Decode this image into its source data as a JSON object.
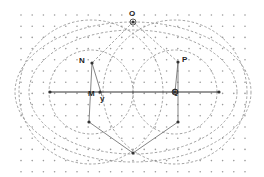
{
  "diagram": {
    "type": "geometry-construction",
    "background": "#ffffff",
    "grid": {
      "style": "dots",
      "color": "#9a9a9a",
      "spacing": 11.2,
      "x0": 21,
      "y0": 15,
      "cols": 21,
      "rows": 15
    },
    "axis_line": {
      "x1": 50,
      "y1": 92,
      "x2": 219,
      "y2": 92,
      "color": "#333333"
    },
    "points": [
      {
        "id": "O",
        "label": "O",
        "x": 133,
        "y": 22
      },
      {
        "id": "N",
        "label": "N",
        "x": 92,
        "y": 63
      },
      {
        "id": "P",
        "label": "P",
        "x": 178,
        "y": 62
      },
      {
        "id": "M",
        "label": "M",
        "x": 100,
        "y": 92
      },
      {
        "id": "Q",
        "label": "Q",
        "x": 175,
        "y": 92
      },
      {
        "id": "y",
        "label": "y",
        "x": 102,
        "y": 96
      },
      {
        "id": "A",
        "label": "",
        "x": 89,
        "y": 122
      },
      {
        "id": "B",
        "label": "",
        "x": 178,
        "y": 122
      },
      {
        "id": "C",
        "label": "",
        "x": 133,
        "y": 153
      },
      {
        "id": "L",
        "label": "",
        "x": 50,
        "y": 92
      },
      {
        "id": "R",
        "label": "",
        "x": 219,
        "y": 92
      }
    ],
    "label_positions": {
      "O": {
        "x": 129,
        "y": 10
      },
      "N": {
        "x": 79,
        "y": 57
      },
      "P": {
        "x": 182,
        "y": 56
      },
      "M": {
        "x": 88,
        "y": 90
      },
      "Q": {
        "x": 172,
        "y": 88
      },
      "y": {
        "x": 100,
        "y": 95
      }
    },
    "dashed_curves": [
      {
        "name": "outer-ellipse",
        "cx": 133,
        "cy": 92,
        "rx": 118,
        "ry": 70
      },
      {
        "name": "middle-ellipse",
        "cx": 133,
        "cy": 92,
        "rx": 104,
        "ry": 62
      },
      {
        "name": "left-circle-large",
        "cx": 91,
        "cy": 92,
        "r": 72
      },
      {
        "name": "right-circle-large",
        "cx": 175,
        "cy": 92,
        "r": 72
      },
      {
        "name": "left-circle-small",
        "cx": 91,
        "cy": 92,
        "r": 42
      },
      {
        "name": "right-circle-small",
        "cx": 175,
        "cy": 92,
        "r": 42
      }
    ],
    "segments": [
      {
        "from": "N",
        "to": "A"
      },
      {
        "from": "P",
        "to": "B"
      },
      {
        "from": "A",
        "to": "C"
      },
      {
        "from": "B",
        "to": "C"
      },
      {
        "from": "N",
        "to": "y"
      },
      {
        "from": "P",
        "to": "Q"
      }
    ],
    "dashed_segments": [
      {
        "from": "O",
        "to": "N"
      },
      {
        "from": "O",
        "to": "P"
      }
    ]
  }
}
